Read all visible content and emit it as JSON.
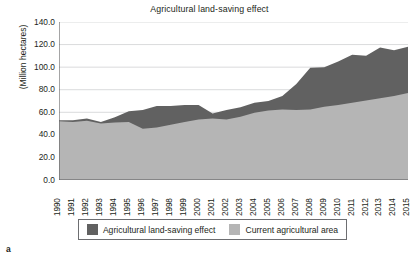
{
  "panel_letter": "a",
  "legend": {
    "entries": [
      {
        "label": "Agricultural land-saving effect",
        "color": "#616161"
      },
      {
        "label": "Current agricultural area",
        "color": "#b5b5b5"
      }
    ]
  },
  "colors": {
    "saving_effect": "#616161",
    "current_area": "#b5b5b5",
    "axis": "#58595b",
    "grid": "#c9cacc",
    "text": "#231f20",
    "background": "#ffffff"
  },
  "chart_data": {
    "type": "area",
    "stacked": true,
    "title": "Agricultural land-saving effect",
    "xlabel": "",
    "ylabel": "(Million hectares)",
    "ylim": [
      0.0,
      140.0
    ],
    "yticks": [
      "0.0",
      "20.0",
      "40.0",
      "60.0",
      "80.0",
      "100.0",
      "120.0",
      "140.0"
    ],
    "ytick_values": [
      0.0,
      20.0,
      40.0,
      60.0,
      80.0,
      100.0,
      120.0,
      140.0
    ],
    "grid": true,
    "grid_axis": "y",
    "legend_position": "bottom",
    "categories": [
      "1990",
      "1991",
      "1992",
      "1993",
      "1994",
      "1995",
      "1996",
      "1997",
      "1998",
      "1999",
      "2000",
      "2001",
      "2002",
      "2003",
      "2004",
      "2005",
      "2006",
      "2007",
      "2008",
      "2009",
      "2010",
      "2011",
      "2012",
      "2013",
      "2014",
      "2015"
    ],
    "x": [
      1990,
      1991,
      1992,
      1993,
      1994,
      1995,
      1996,
      1997,
      1998,
      1999,
      2000,
      2001,
      2002,
      2003,
      2004,
      2005,
      2006,
      2007,
      2008,
      2009,
      2010,
      2011,
      2012,
      2013,
      2014,
      2015
    ],
    "series": [
      {
        "name": "Current agricultural area",
        "color": "#b5b5b5",
        "values": [
          52.0,
          51.5,
          52.5,
          50.0,
          51.0,
          51.5,
          45.5,
          46.5,
          49.0,
          51.5,
          53.5,
          54.5,
          53.5,
          56.0,
          59.5,
          61.5,
          62.5,
          62.0,
          62.5,
          65.0,
          66.5,
          68.5,
          70.5,
          72.5,
          74.5,
          77.0
        ]
      },
      {
        "name": "Agricultural land-saving effect",
        "color": "#616161",
        "values": [
          1.0,
          1.5,
          2.0,
          1.5,
          4.5,
          9.5,
          16.5,
          19.0,
          16.5,
          15.0,
          13.0,
          4.5,
          8.5,
          8.5,
          9.0,
          8.5,
          12.0,
          23.0,
          37.0,
          35.0,
          38.5,
          42.5,
          39.5,
          45.0,
          40.5,
          41.0
        ]
      }
    ],
    "totals": [
      53.0,
      53.0,
      54.5,
      51.5,
      55.5,
      61.0,
      62.0,
      65.5,
      65.5,
      66.5,
      66.5,
      59.0,
      62.0,
      64.5,
      68.5,
      70.0,
      74.5,
      85.0,
      99.5,
      100.0,
      105.0,
      111.0,
      110.0,
      117.5,
      115.0,
      118.0
    ]
  }
}
